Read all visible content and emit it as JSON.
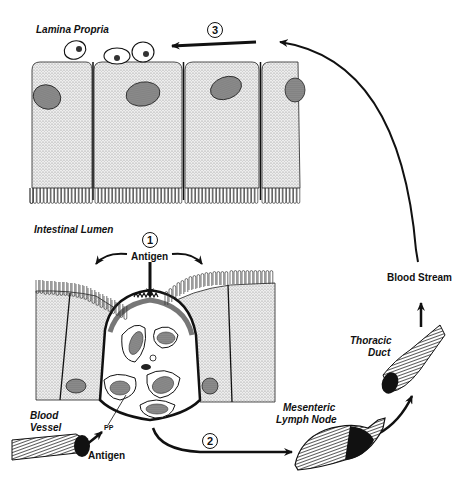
{
  "labels": {
    "lamina_propria": "Lamina Propria",
    "intestinal_lumen": "Intestinal Lumen",
    "antigen_top": "Antigen",
    "antigen_bottom": "Antigen",
    "blood_vessel": "Blood\nVessel",
    "blood_vessel_line1": "Blood",
    "blood_vessel_line2": "Vessel",
    "pp": "PP",
    "mesenteric_line1": "Mesenteric",
    "mesenteric_line2": "Lymph Node",
    "thoracic_line1": "Thoracic",
    "thoracic_line2": "Duct",
    "blood_stream": "Blood Stream",
    "cell_marker_L": "L",
    "cell_marker_M": "M"
  },
  "steps": [
    {
      "number": "1",
      "description": "Antigen uptake through M cell into Peyer's patch"
    },
    {
      "number": "2",
      "description": "Migration to Mesenteric Lymph Node"
    },
    {
      "number": "3",
      "description": "Return to Lamina Propria via Blood Stream"
    }
  ],
  "colors": {
    "ink": "#111111",
    "stipple": "#d4d4d4",
    "nucleus": "#8a8a8a",
    "background": "#ffffff"
  }
}
